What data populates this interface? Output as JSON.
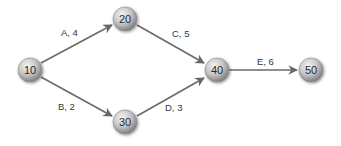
{
  "diagram": {
    "type": "activity-on-arrow network",
    "colors": {
      "edge": "#666666",
      "node_light": "#f2f2f2",
      "node_mid": "#bdbdbd",
      "node_dark": "#7a7a7a",
      "text": "#2a2a2a"
    },
    "nodes": [
      {
        "id": "10",
        "label": "10",
        "x": 30,
        "y": 70
      },
      {
        "id": "20",
        "label": "20",
        "x": 125,
        "y": 19
      },
      {
        "id": "30",
        "label": "30",
        "x": 125,
        "y": 122
      },
      {
        "id": "40",
        "label": "40",
        "x": 217,
        "y": 70
      },
      {
        "id": "50",
        "label": "50",
        "x": 311,
        "y": 70
      }
    ],
    "edges": [
      {
        "from": "10",
        "to": "20",
        "label": "A, 4",
        "activity": "A",
        "duration": 4
      },
      {
        "from": "10",
        "to": "30",
        "label": "B, 2",
        "activity": "B",
        "duration": 2
      },
      {
        "from": "20",
        "to": "40",
        "label": "C, 5",
        "activity": "C",
        "duration": 5
      },
      {
        "from": "30",
        "to": "40",
        "label": "D, 3",
        "activity": "D",
        "duration": 3
      },
      {
        "from": "40",
        "to": "50",
        "label": "E, 6",
        "activity": "E",
        "duration": 6
      }
    ]
  }
}
